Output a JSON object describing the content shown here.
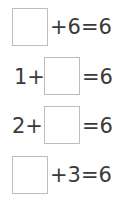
{
  "equations": [
    {
      "blank_position": "first",
      "before": "",
      "after": "+6=6",
      "answer_box_value": ""
    },
    {
      "blank_position": "second",
      "before": "1+",
      "after": "=6",
      "answer_box_value": ""
    },
    {
      "blank_position": "second",
      "before": "2+",
      "after": "=6",
      "answer_box_value": ""
    },
    {
      "blank_position": "first",
      "before": "",
      "after": "+3=6",
      "answer_box_value": ""
    }
  ]
}
